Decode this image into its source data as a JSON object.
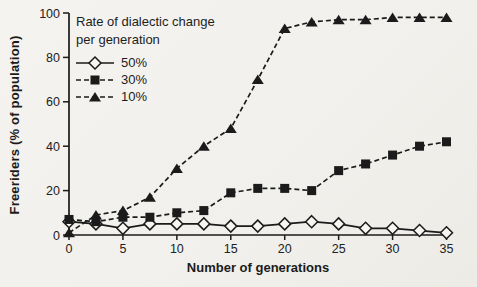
{
  "figure": {
    "background": "#f2f1ed",
    "ink": "#1b1b1b",
    "marker_fill_open": "#f7f6f3"
  },
  "chart_data": {
    "type": "line",
    "title": "",
    "xlabel": "Number of generations",
    "ylabel": "Freeriders (% of population)",
    "xlim": [
      0,
      35
    ],
    "ylim": [
      0,
      100
    ],
    "x_ticks": [
      0,
      5,
      10,
      15,
      20,
      25,
      30,
      35
    ],
    "y_ticks": [
      0,
      20,
      40,
      60,
      80,
      100
    ],
    "grid": false,
    "legend": {
      "title_lines": [
        "Rate of dialectic change",
        "per generation"
      ],
      "position": "top-left"
    },
    "x": [
      0,
      2.5,
      5,
      7.5,
      10,
      12.5,
      15,
      17.5,
      20,
      22.5,
      25,
      27.5,
      30,
      32.5,
      35
    ],
    "series": [
      {
        "name": "50%",
        "marker": "diamond-open",
        "line": "solid",
        "values": [
          6,
          5,
          3,
          5,
          5,
          5,
          4,
          4,
          5,
          6,
          5,
          3,
          3,
          2,
          1
        ]
      },
      {
        "name": "30%",
        "marker": "square-filled",
        "line": "dashed",
        "values": [
          7,
          6,
          8,
          8,
          10,
          11,
          19,
          21,
          21,
          20,
          29,
          32,
          36,
          40,
          42
        ]
      },
      {
        "name": "10%",
        "marker": "triangle-filled",
        "line": "dashed",
        "values": [
          1,
          9,
          11,
          17,
          30,
          40,
          48,
          70,
          93,
          96,
          97,
          97,
          98,
          98,
          98
        ]
      }
    ]
  }
}
